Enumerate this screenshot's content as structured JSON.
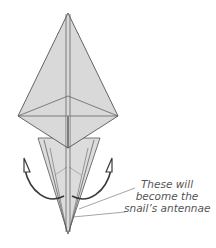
{
  "diagram": {
    "paper_fill": "#d9d9d9",
    "paper_fill_light": "#e3e3e3",
    "line_color": "#555555",
    "arrow_color": "#3a3a3a",
    "annotation": {
      "lines": [
        "These will",
        "become the",
        "snail’s antennae"
      ]
    },
    "arrows": [
      {
        "name": "left-fold-arrow",
        "direction": "down-right"
      },
      {
        "name": "right-fold-arrow",
        "direction": "down-left"
      }
    ]
  }
}
